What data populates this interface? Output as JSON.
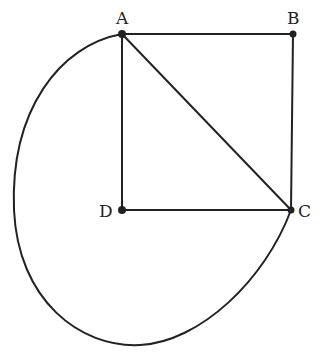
{
  "diagram": {
    "points": [
      {
        "label": "A",
        "x": 122,
        "y": 34,
        "lx": 116,
        "ly": 10
      },
      {
        "label": "B",
        "x": 293,
        "y": 34,
        "lx": 287,
        "ly": 10
      },
      {
        "label": "C",
        "x": 291,
        "y": 210,
        "lx": 298,
        "ly": 203
      },
      {
        "label": "D",
        "x": 122,
        "y": 210,
        "lx": 99,
        "ly": 203
      }
    ],
    "segments": [
      [
        "A",
        "B"
      ],
      [
        "B",
        "C"
      ],
      [
        "C",
        "D"
      ],
      [
        "D",
        "A"
      ],
      [
        "A",
        "C"
      ]
    ],
    "curve": "from A around the left and bottom back to C",
    "colors": {
      "stroke": "#222222",
      "background": "#ffffff"
    }
  }
}
